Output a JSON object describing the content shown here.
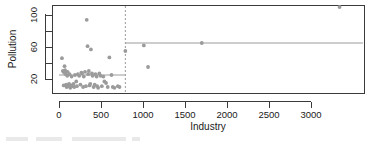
{
  "chart_data": {
    "type": "scatter",
    "title": "",
    "xlabel": "Industry",
    "ylabel": "Pollution",
    "xlim": [
      -90,
      3650
    ],
    "ylim": [
      4,
      116
    ],
    "xticks": [
      0,
      500,
      1000,
      1500,
      2000,
      2500,
      3000
    ],
    "xticklabels": [
      "0",
      "500",
      "1000",
      "1500",
      "2000",
      "2500",
      "3000"
    ],
    "yticks": [
      20,
      60,
      100
    ],
    "yticklabels": [
      "20",
      "60",
      "100"
    ],
    "yminorticks": [
      40,
      80
    ],
    "grid": false,
    "legend": false,
    "points": [
      {
        "x": 35,
        "y": 46
      },
      {
        "x": 46,
        "y": 30
      },
      {
        "x": 56,
        "y": 12
      },
      {
        "x": 61,
        "y": 28
      },
      {
        "x": 66,
        "y": 36
      },
      {
        "x": 72,
        "y": 31
      },
      {
        "x": 80,
        "y": 26
      },
      {
        "x": 85,
        "y": 13
      },
      {
        "x": 91,
        "y": 10
      },
      {
        "x": 98,
        "y": 24
      },
      {
        "x": 103,
        "y": 29
      },
      {
        "x": 112,
        "y": 11
      },
      {
        "x": 120,
        "y": 14
      },
      {
        "x": 126,
        "y": 26
      },
      {
        "x": 134,
        "y": 9
      },
      {
        "x": 142,
        "y": 12
      },
      {
        "x": 150,
        "y": 23
      },
      {
        "x": 160,
        "y": 11
      },
      {
        "x": 172,
        "y": 14
      },
      {
        "x": 181,
        "y": 10
      },
      {
        "x": 190,
        "y": 25
      },
      {
        "x": 205,
        "y": 17
      },
      {
        "x": 213,
        "y": 11
      },
      {
        "x": 225,
        "y": 26
      },
      {
        "x": 240,
        "y": 24
      },
      {
        "x": 255,
        "y": 13
      },
      {
        "x": 266,
        "y": 28
      },
      {
        "x": 275,
        "y": 27
      },
      {
        "x": 287,
        "y": 10
      },
      {
        "x": 295,
        "y": 23
      },
      {
        "x": 310,
        "y": 29
      },
      {
        "x": 320,
        "y": 11
      },
      {
        "x": 330,
        "y": 94
      },
      {
        "x": 340,
        "y": 61
      },
      {
        "x": 347,
        "y": 26
      },
      {
        "x": 355,
        "y": 30
      },
      {
        "x": 364,
        "y": 12
      },
      {
        "x": 372,
        "y": 14
      },
      {
        "x": 380,
        "y": 57
      },
      {
        "x": 392,
        "y": 27
      },
      {
        "x": 400,
        "y": 24
      },
      {
        "x": 412,
        "y": 10
      },
      {
        "x": 425,
        "y": 13
      },
      {
        "x": 434,
        "y": 26
      },
      {
        "x": 448,
        "y": 23
      },
      {
        "x": 455,
        "y": 11
      },
      {
        "x": 466,
        "y": 9
      },
      {
        "x": 480,
        "y": 27
      },
      {
        "x": 495,
        "y": 24
      },
      {
        "x": 510,
        "y": 11
      },
      {
        "x": 528,
        "y": 23
      },
      {
        "x": 540,
        "y": 17
      },
      {
        "x": 560,
        "y": 15
      },
      {
        "x": 580,
        "y": 10
      },
      {
        "x": 600,
        "y": 47
      },
      {
        "x": 625,
        "y": 25
      },
      {
        "x": 640,
        "y": 10
      },
      {
        "x": 660,
        "y": 9
      },
      {
        "x": 700,
        "y": 11
      },
      {
        "x": 720,
        "y": 10
      },
      {
        "x": 790,
        "y": 55
      },
      {
        "x": 1010,
        "y": 62
      },
      {
        "x": 1060,
        "y": 35
      },
      {
        "x": 1700,
        "y": 65
      },
      {
        "x": 3340,
        "y": 110
      }
    ],
    "fit": {
      "type": "step",
      "split_x": 790,
      "segments": [
        {
          "x0": 0,
          "x1": 790,
          "y": 25
        },
        {
          "x0": 790,
          "x1": 3620,
          "y": 65
        }
      ]
    },
    "split_marker": {
      "x": 790,
      "style": "dashed",
      "color": "#9b9b9b"
    },
    "colors": {
      "point": "#9b9b9b",
      "fit": "#9b9b9b",
      "axis": "#3b3b3b",
      "text": "#1a1a1a",
      "background": "#ffffff"
    }
  }
}
